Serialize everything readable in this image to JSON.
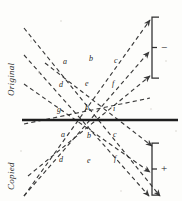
{
  "figure": {
    "name": "ray-diagram-original-copied",
    "background_color": "#fdfdfb",
    "ink_color": "#3a3a3a",
    "interface_line_color": "#1e1e1e",
    "side_labels": {
      "top": "Original",
      "bottom": "Copied"
    },
    "brackets": [
      {
        "id": "bracket-top",
        "sign": "−",
        "x": 152,
        "y": 17,
        "height": 61
      },
      {
        "id": "bracket-bottom",
        "sign": "+",
        "x": 152,
        "y": 143,
        "height": 52
      }
    ],
    "interface": {
      "label": "interface-line",
      "x1": 22,
      "x2": 178,
      "y": 120,
      "thickness": 2.4
    },
    "ray_labels": [
      {
        "text": "a",
        "x": 63,
        "y": 58,
        "region": "original"
      },
      {
        "text": "b",
        "x": 89,
        "y": 55,
        "region": "original"
      },
      {
        "text": "c",
        "x": 114,
        "y": 57,
        "region": "original"
      },
      {
        "text": "d",
        "x": 59,
        "y": 81,
        "region": "original"
      },
      {
        "text": "e",
        "x": 85,
        "y": 80,
        "region": "original"
      },
      {
        "text": "f",
        "x": 112,
        "y": 80,
        "region": "original"
      },
      {
        "text": "g",
        "x": 57,
        "y": 106,
        "region": "original"
      },
      {
        "text": "h",
        "x": 85,
        "y": 104,
        "region": "original"
      },
      {
        "text": "i",
        "x": 113,
        "y": 105,
        "region": "original"
      },
      {
        "text": "a",
        "x": 61,
        "y": 131,
        "region": "copied"
      },
      {
        "text": "b",
        "x": 87,
        "y": 132,
        "region": "copied"
      },
      {
        "text": "c",
        "x": 113,
        "y": 131,
        "region": "copied"
      },
      {
        "text": "d",
        "x": 59,
        "y": 156,
        "region": "copied"
      },
      {
        "text": "e",
        "x": 87,
        "y": 157,
        "region": "copied"
      },
      {
        "text": "f",
        "x": 114,
        "y": 155,
        "region": "copied"
      }
    ],
    "down_right_rays": [
      {
        "id": "ray-dr-1",
        "x1": 24,
        "y1": 28,
        "x2": 160,
        "y2": 196,
        "arrow": true
      },
      {
        "id": "ray-dr-2",
        "x1": 24,
        "y1": 55,
        "x2": 149,
        "y2": 196,
        "arrow": true
      },
      {
        "id": "ray-dr-3",
        "x1": 24,
        "y1": 84,
        "x2": 150,
        "y2": 172,
        "arrow": true
      },
      {
        "id": "ray-dr-4",
        "x1": 45,
        "y1": 63,
        "x2": 152,
        "y2": 146,
        "arrow": true
      }
    ],
    "up_right_rays": [
      {
        "id": "ray-ur-1",
        "x1": 24,
        "y1": 196,
        "x2": 150,
        "y2": 20,
        "arrow": true
      },
      {
        "id": "ray-ur-2",
        "x1": 24,
        "y1": 196,
        "x2": 149,
        "y2": 52,
        "arrow": true
      },
      {
        "id": "ray-ur-3",
        "x1": 28,
        "y1": 176,
        "x2": 150,
        "y2": 76,
        "arrow": true
      },
      {
        "id": "ray-ur-4",
        "x1": 24,
        "y1": 124,
        "x2": 150,
        "y2": 98,
        "arrow": false
      }
    ]
  }
}
